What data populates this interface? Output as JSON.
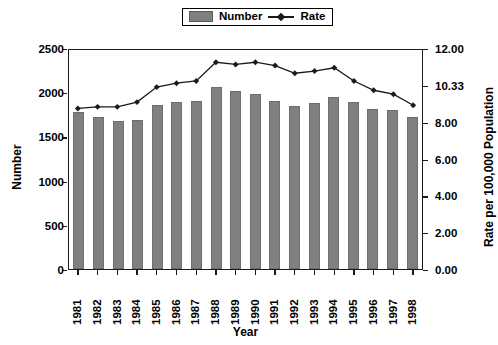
{
  "chart_data": {
    "type": "bar",
    "title": "",
    "xlabel": "Year",
    "ylabel": "Number",
    "ylabel_right": "Rate per 100,000 Population",
    "categories": [
      "1981",
      "1982",
      "1983",
      "1984",
      "1985",
      "1986",
      "1987",
      "1988",
      "1989",
      "1990",
      "1991",
      "1992",
      "1993",
      "1994",
      "1995",
      "1996",
      "1997",
      "1998"
    ],
    "ylim": [
      0,
      2500
    ],
    "yticks": [
      "0",
      "500",
      "1000",
      "1500",
      "2000",
      "2500"
    ],
    "ylim_right": [
      0,
      12
    ],
    "yticks_right": [
      "0.00",
      "2.00",
      "4.00",
      "6.00",
      "8.00",
      "10.33",
      "12.00"
    ],
    "grid": false,
    "legend_position": "top-center",
    "series": [
      {
        "name": "Number",
        "type": "bar",
        "color": "#808080",
        "values": [
          1780,
          1725,
          1670,
          1690,
          1850,
          1890,
          1900,
          2055,
          2010,
          1980,
          1900,
          1840,
          1875,
          1950,
          1890,
          1805,
          1795,
          1720
        ]
      },
      {
        "name": "Rate",
        "type": "line",
        "color": "#1a1a1a",
        "marker": "diamond",
        "values": [
          8.9,
          9.0,
          9.0,
          9.3,
          10.25,
          10.45,
          10.55,
          11.4,
          11.3,
          11.4,
          11.25,
          10.9,
          11.0,
          11.15,
          10.55,
          10.05,
          9.8,
          9.1
        ]
      }
    ]
  },
  "legend": {
    "number_label": "Number",
    "rate_label": "Rate"
  }
}
